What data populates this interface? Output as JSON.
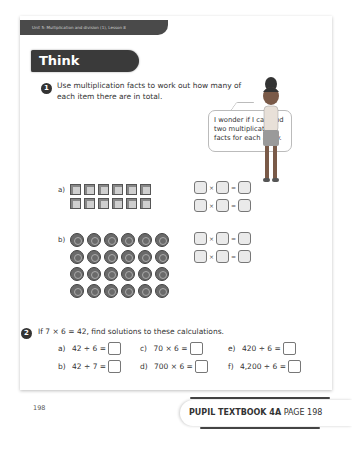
{
  "header": {
    "unit_label": "Unit 5: Multiplication and division (1), Lesson 8",
    "section_title": "Think together"
  },
  "question1": {
    "number": "1",
    "text": "Use multiplication facts to work out how many of each item there are in total.",
    "speech_bubble": "I wonder if I can find two multiplication facts for each array.",
    "parts": [
      {
        "label": "a)",
        "item": "cube",
        "rows": 2,
        "cols": 6
      },
      {
        "label": "b)",
        "item": "counter",
        "rows": 4,
        "cols": 6
      }
    ],
    "equation_symbols": {
      "times": "×",
      "equals": "="
    }
  },
  "question2": {
    "number": "2",
    "text": "If 7 × 6 = 42, find solutions to these calculations.",
    "calculations": [
      {
        "label": "a)",
        "expr": "42 ÷ 6 ="
      },
      {
        "label": "b)",
        "expr": "42 ÷ 7 ="
      },
      {
        "label": "c)",
        "expr": "70 × 6 ="
      },
      {
        "label": "d)",
        "expr": "700 × 6 ="
      },
      {
        "label": "e)",
        "expr": "420 ÷ 6 ="
      },
      {
        "label": "f)",
        "expr": "4,200 ÷ 6 ="
      }
    ]
  },
  "page_number": "198",
  "footer": {
    "book": "PUPIL TEXTBOOK 4A",
    "page": "PAGE 198"
  }
}
